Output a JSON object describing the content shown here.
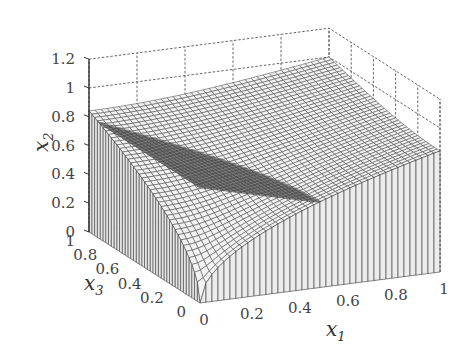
{
  "chart_data": {
    "type": "surface3d",
    "title": "",
    "axes": {
      "x1": {
        "label": "x",
        "sub": "1",
        "range": [
          0,
          1
        ],
        "ticks": [
          "0",
          "0.2",
          "0.4",
          "0.6",
          "0.8",
          "1"
        ],
        "tick_values": [
          0,
          0.2,
          0.4,
          0.6,
          0.8,
          1
        ]
      },
      "x3": {
        "label": "x",
        "sub": "3",
        "range": [
          0,
          1
        ],
        "ticks": [
          "0",
          "0.2",
          "0.4",
          "0.6",
          "0.8",
          "1"
        ],
        "tick_values": [
          0,
          0.2,
          0.4,
          0.6,
          0.8,
          1
        ]
      },
      "x2": {
        "label": "x",
        "sub": "2",
        "range": [
          0,
          1.2
        ],
        "ticks": [
          "0",
          "0.2",
          "0.4",
          "0.6",
          "0.8",
          "1",
          "1.2"
        ],
        "tick_values": [
          0,
          0.2,
          0.4,
          0.6,
          0.8,
          1,
          1.2
        ]
      }
    },
    "grid": true,
    "series": [
      {
        "name": "curved-surface",
        "shade": "light",
        "description": "x2 = sqrt(x1^2 + x3^2)-like concave surface, 0 at origin rising to ~1 at (1,1)",
        "function": "min(1, sqrt(x1*x1 + x3*x3) / 1.414 * 1.0) approx",
        "samples": 40
      },
      {
        "name": "planar-surface",
        "shade": "dark",
        "description": "plane x2 = 0.8 - 0.45*x1 - 0.0*x3 clipped above curved surface",
        "corner_values": {
          "x1_0_x3_1": 0.8,
          "x1_1_x3_0": 0.38,
          "x1_0_x3_0": 0.8,
          "x1_1_x3_1": 0.38
        },
        "samples": 40
      }
    ]
  }
}
